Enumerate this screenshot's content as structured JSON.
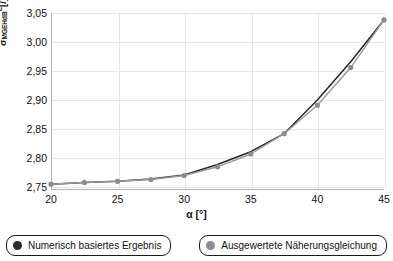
{
  "chart_data": {
    "type": "line",
    "title": "",
    "xlabel": "α [°]",
    "ylabel_main": "σ",
    "ylabel_sub": "MGEHdB",
    "ylabel_sup": "E",
    "ylabel_unit": "[/]",
    "ylabel": "σ_MGEHdB^E [/]",
    "xlim": [
      20,
      45
    ],
    "ylim": [
      2.745,
      3.05
    ],
    "grid": true,
    "legend_position": "bottom",
    "xticks": [
      "20",
      "25",
      "30",
      "35",
      "40",
      "45"
    ],
    "xtick_values": [
      20,
      25,
      30,
      35,
      40,
      45
    ],
    "yticks": [
      "2,75",
      "2,80",
      "2,85",
      "2,90",
      "2,95",
      "3,00",
      "3,05"
    ],
    "ytick_values": [
      2.75,
      2.8,
      2.85,
      2.9,
      2.95,
      3.0,
      3.05
    ],
    "x": [
      20,
      22.5,
      25,
      27.5,
      30,
      32.5,
      35,
      37.5,
      40,
      42.5,
      45
    ],
    "series": [
      {
        "name": "Numerisch basiertes Ergebnis",
        "color": "#262626",
        "marker_color": "#2b2b2b",
        "values": [
          2.755,
          2.758,
          2.76,
          2.764,
          2.771,
          2.789,
          2.811,
          2.842,
          2.9,
          2.966,
          3.038
        ]
      },
      {
        "name": "Ausgewertete Näherungsgleichung",
        "color": "#9a9a9a",
        "marker_color": "#8c8c8c",
        "values": [
          2.755,
          2.758,
          2.76,
          2.763,
          2.77,
          2.785,
          2.807,
          2.842,
          2.891,
          2.956,
          3.038
        ]
      }
    ]
  },
  "legend": {
    "items": [
      {
        "label": "Numerisch basiertes Ergebnis",
        "color": "#2b2b2b"
      },
      {
        "label": "Ausgewertete Näherungsgleichung",
        "color": "#8c8c8c"
      }
    ]
  },
  "colors": {
    "background": "#ffffff",
    "axis": "#b4b4b4",
    "grid": "#e6e6e6",
    "text": "#111111",
    "series_1": "#262626",
    "series_2": "#9a9a9a"
  }
}
